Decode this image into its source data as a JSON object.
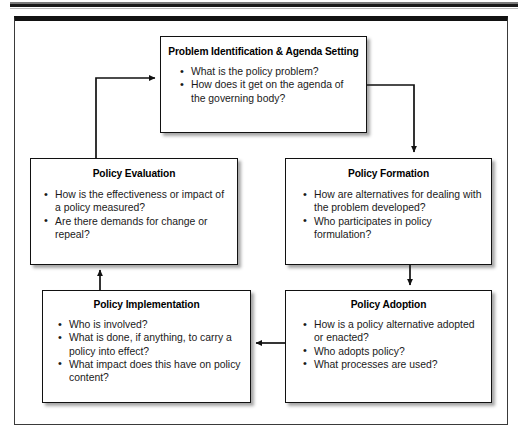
{
  "figure": {
    "kind": "policy-process-cycle-flowchart"
  },
  "nodes": {
    "problem_identification": {
      "title": "Problem Identification & Agenda Setting",
      "bullets": [
        "What is the policy problem?",
        "How does it get on the agenda of the governing body?"
      ]
    },
    "policy_evaluation": {
      "title": "Policy Evaluation",
      "bullets": [
        "How is the effectiveness or impact of a policy measured?",
        "Are there demands for change or repeal?"
      ]
    },
    "policy_formation": {
      "title": "Policy Formation",
      "bullets": [
        "How are alternatives for dealing with the problem developed?",
        "Who participates in policy formulation?"
      ]
    },
    "policy_implementation": {
      "title": "Policy Implementation",
      "bullets": [
        "Who is involved?",
        "What is done, if anything, to carry a policy into effect?",
        "What impact does this have on policy content?"
      ]
    },
    "policy_adoption": {
      "title": "Policy Adoption",
      "bullets": [
        "How is a policy alternative adopted or enacted?",
        "Who adopts policy?",
        "What processes are used?"
      ]
    }
  },
  "connectors": [
    {
      "name": "problem-to-formation",
      "from": "problem_identification",
      "to": "policy_formation",
      "direction": "right-then-down"
    },
    {
      "name": "formation-to-adoption",
      "from": "policy_formation",
      "to": "policy_adoption",
      "direction": "down"
    },
    {
      "name": "adoption-to-implementation",
      "from": "policy_adoption",
      "to": "policy_implementation",
      "direction": "left"
    },
    {
      "name": "implementation-to-evaluation",
      "from": "policy_implementation",
      "to": "policy_evaluation",
      "direction": "up"
    },
    {
      "name": "evaluation-to-problem",
      "from": "policy_evaluation",
      "to": "problem_identification",
      "direction": "up-then-right"
    }
  ],
  "colors": {
    "line": "#111111",
    "box_border": "#111111",
    "box_fill": "#ffffff",
    "text": "#1a1a1a",
    "frame": "#3a3a3a"
  }
}
